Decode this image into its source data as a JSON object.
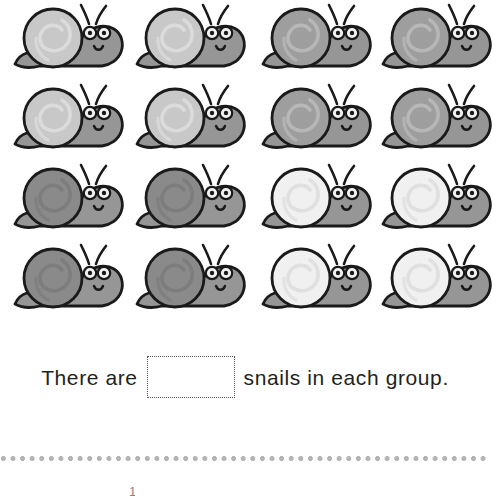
{
  "worksheet": {
    "sentence_prefix": "There are",
    "sentence_suffix": "snails in each group.",
    "answer_value": "",
    "answer_placeholder": "",
    "bottom_mark": "1"
  },
  "palette": {
    "outline": "#1a1a1a",
    "body_fill": "#969696",
    "body_shadow": "#7d7d7d",
    "eye_white": "#f2f2f2",
    "pupil": "#1a1a1a",
    "page_background": "#ffffff",
    "text_color": "#231f20",
    "answer_box_border": "#585858",
    "separator_dot": "#b4b4b4",
    "shell_very_light": "#f0f0f0",
    "shell_light": "#c8c8c8",
    "shell_medium": "#9e9e9e",
    "shell_dark": "#8a8a8a"
  },
  "grid": {
    "rows": 4,
    "columns": 4,
    "total_snails": 16,
    "groups": 4,
    "snails_per_group": 4,
    "cells": [
      {
        "row": 1,
        "col": 1,
        "x": 10,
        "y": 2,
        "shell_shade": "#c8c8c8",
        "shell_swirl": "#dcdcdc",
        "name": "snail-r1c1"
      },
      {
        "row": 1,
        "col": 2,
        "x": 132,
        "y": 2,
        "shell_shade": "#c8c8c8",
        "shell_swirl": "#dcdcdc",
        "name": "snail-r1c2"
      },
      {
        "row": 1,
        "col": 3,
        "x": 258,
        "y": 2,
        "shell_shade": "#9e9e9e",
        "shell_swirl": "#b8b8b8",
        "name": "snail-r1c3"
      },
      {
        "row": 1,
        "col": 4,
        "x": 378,
        "y": 2,
        "shell_shade": "#9e9e9e",
        "shell_swirl": "#b8b8b8",
        "name": "snail-r1c4"
      },
      {
        "row": 2,
        "col": 1,
        "x": 10,
        "y": 82,
        "shell_shade": "#c8c8c8",
        "shell_swirl": "#dcdcdc",
        "name": "snail-r2c1"
      },
      {
        "row": 2,
        "col": 2,
        "x": 132,
        "y": 82,
        "shell_shade": "#c8c8c8",
        "shell_swirl": "#dcdcdc",
        "name": "snail-r2c2"
      },
      {
        "row": 2,
        "col": 3,
        "x": 258,
        "y": 82,
        "shell_shade": "#9e9e9e",
        "shell_swirl": "#b8b8b8",
        "name": "snail-r2c3"
      },
      {
        "row": 2,
        "col": 4,
        "x": 378,
        "y": 82,
        "shell_shade": "#9e9e9e",
        "shell_swirl": "#b8b8b8",
        "name": "snail-r2c4"
      },
      {
        "row": 3,
        "col": 1,
        "x": 10,
        "y": 162,
        "shell_shade": "#8a8a8a",
        "shell_swirl": "#7c7c7c",
        "name": "snail-r3c1"
      },
      {
        "row": 3,
        "col": 2,
        "x": 132,
        "y": 162,
        "shell_shade": "#8a8a8a",
        "shell_swirl": "#7c7c7c",
        "name": "snail-r3c2"
      },
      {
        "row": 3,
        "col": 3,
        "x": 258,
        "y": 162,
        "shell_shade": "#f0f0f0",
        "shell_swirl": "#dedede",
        "name": "snail-r3c3"
      },
      {
        "row": 3,
        "col": 4,
        "x": 378,
        "y": 162,
        "shell_shade": "#f0f0f0",
        "shell_swirl": "#dedede",
        "name": "snail-r3c4"
      },
      {
        "row": 4,
        "col": 1,
        "x": 10,
        "y": 242,
        "shell_shade": "#8a8a8a",
        "shell_swirl": "#7c7c7c",
        "name": "snail-r4c1"
      },
      {
        "row": 4,
        "col": 2,
        "x": 132,
        "y": 242,
        "shell_shade": "#8a8a8a",
        "shell_swirl": "#7c7c7c",
        "name": "snail-r4c2"
      },
      {
        "row": 4,
        "col": 3,
        "x": 258,
        "y": 242,
        "shell_shade": "#f0f0f0",
        "shell_swirl": "#dedede",
        "name": "snail-r4c3"
      },
      {
        "row": 4,
        "col": 4,
        "x": 378,
        "y": 242,
        "shell_shade": "#f0f0f0",
        "shell_swirl": "#dedede",
        "name": "snail-r4c4"
      }
    ]
  }
}
